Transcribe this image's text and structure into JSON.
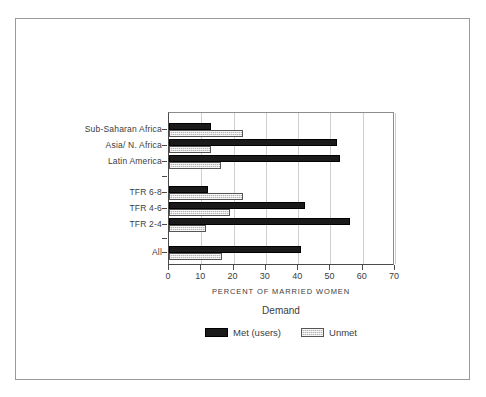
{
  "chart_data": {
    "type": "bar",
    "orientation": "horizontal",
    "title": "",
    "xlabel": "PERCENT OF MARRIED WOMEN",
    "ylabel": "",
    "xlim": [
      0,
      70
    ],
    "xticks": [
      0,
      10,
      20,
      30,
      40,
      50,
      60,
      70
    ],
    "grid": "vertical",
    "legend_title": "Demand",
    "legend_position": "bottom-center",
    "categories": [
      "Sub-Saharan Africa",
      "Asia/ N. Africa",
      "Latin America",
      "TFR 6-8",
      "TFR 4-6",
      "TFR 2-4",
      "All"
    ],
    "series": [
      {
        "name": "Met (users)",
        "color": "#1a1a1a",
        "values": [
          13,
          52,
          53,
          12,
          42,
          56,
          41
        ]
      },
      {
        "name": "Unmet",
        "color": "#b4b4b4",
        "values": [
          23,
          13,
          16,
          23,
          19,
          11.5,
          16.5
        ]
      }
    ]
  },
  "axis": {
    "x_title": "PERCENT OF MARRIED WOMEN",
    "tick_labels": [
      "0",
      "10",
      "20",
      "30",
      "40",
      "50",
      "60",
      "70"
    ],
    "category_labels": [
      "Sub-Saharan Africa",
      "Asia/ N. Africa",
      "Latin America",
      "TFR 6-8",
      "TFR 4-6",
      "TFR 2-4",
      "All"
    ]
  },
  "legend": {
    "title": "Demand",
    "entries": [
      {
        "label": "Met (users)",
        "swatch": "met"
      },
      {
        "label": "Unmet",
        "swatch": "unmet"
      }
    ]
  },
  "colors": {
    "met": "#1a1a1a",
    "unmet": "#b4b4b4",
    "grid": "#cfcfcf",
    "axis": "#4a4a4a",
    "text": "#3c3c3c",
    "frame": "#9a9a9a",
    "background": "#ffffff"
  }
}
